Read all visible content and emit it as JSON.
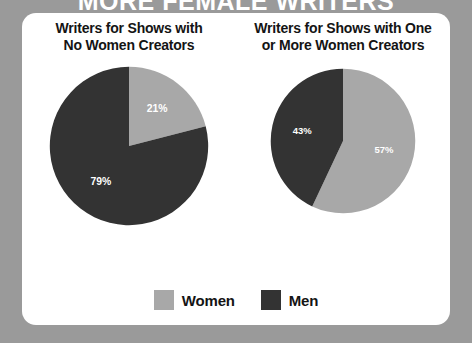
{
  "banner": {
    "headline": "MORE FEMALE WRITERS"
  },
  "colors": {
    "women": "#a8a8a8",
    "men": "#333333",
    "card_background": "#ffffff",
    "page_background": "#9a9a9a",
    "label_text": "#ffffff",
    "title_text": "#141414"
  },
  "panels": [
    {
      "title_line1": "Writers for Shows with",
      "title_line2": "No Women Creators",
      "slices": [
        {
          "name": "Women",
          "value": 21,
          "label": "21%",
          "color": "#a8a8a8"
        },
        {
          "name": "Men",
          "value": 79,
          "label": "79%",
          "color": "#333333"
        }
      ]
    },
    {
      "title_line1": "Writers for Shows with One",
      "title_line2": "or More Women Creators",
      "slices": [
        {
          "name": "Women",
          "value": 57,
          "label": "57%",
          "color": "#a8a8a8"
        },
        {
          "name": "Men",
          "value": 43,
          "label": "43%",
          "color": "#333333"
        }
      ]
    }
  ],
  "legend": {
    "items": [
      {
        "label": "Women",
        "color": "#a8a8a8"
      },
      {
        "label": "Men",
        "color": "#333333"
      }
    ]
  },
  "chart_data": {
    "type": "pie",
    "title": "MORE FEMALE WRITERS",
    "legend": [
      "Women",
      "Men"
    ],
    "legend_position": "bottom",
    "units": "percent",
    "charts": [
      {
        "title": "Writers for Shows with No Women Creators",
        "categories": [
          "Women",
          "Men"
        ],
        "values": [
          21,
          79
        ],
        "labels": [
          "21%",
          "79%"
        ],
        "colors": [
          "#a8a8a8",
          "#333333"
        ],
        "start_angle_deg": 0,
        "direction": "clockwise"
      },
      {
        "title": "Writers for Shows with One or More Women Creators",
        "categories": [
          "Women",
          "Men"
        ],
        "values": [
          57,
          43
        ],
        "labels": [
          "57%",
          "43%"
        ],
        "colors": [
          "#a8a8a8",
          "#333333"
        ],
        "start_angle_deg": 0,
        "direction": "clockwise"
      }
    ]
  }
}
